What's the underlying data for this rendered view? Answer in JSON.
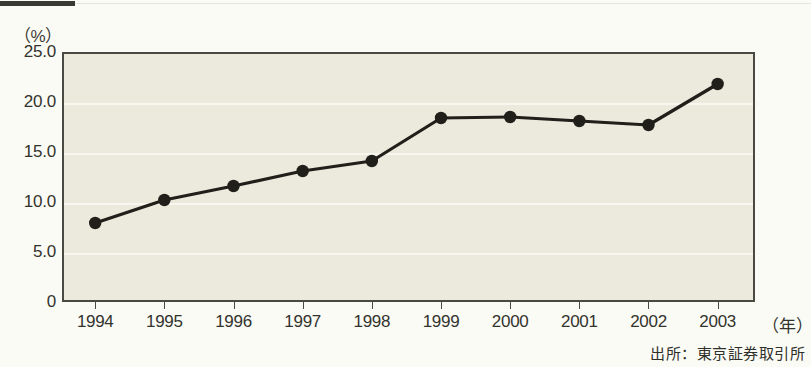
{
  "figure": {
    "unit_label": "（%）",
    "x_unit_label": "（年）",
    "source_note": "出所：東京証券取引所"
  },
  "chart_data": {
    "type": "line",
    "title": "",
    "subtitle": "",
    "xlabel": "（年）",
    "ylabel": "（%）",
    "categories": [
      "1994",
      "1995",
      "1996",
      "1997",
      "1998",
      "1999",
      "2000",
      "2001",
      "2002",
      "2003"
    ],
    "values": [
      7.9,
      10.2,
      11.6,
      13.1,
      14.1,
      18.4,
      18.5,
      18.1,
      17.7,
      21.8
    ],
    "series": [
      {
        "name": "",
        "values": [
          7.9,
          10.2,
          11.6,
          13.1,
          14.1,
          18.4,
          18.5,
          18.1,
          17.7,
          21.8
        ]
      }
    ],
    "ylim": [
      0,
      25
    ],
    "xlim": [
      "1994",
      "2003"
    ],
    "ytick_labels": [
      "25.0",
      "20.0",
      "15.0",
      "10.0",
      "5.0",
      "0"
    ],
    "ytick_values": [
      25.0,
      20.0,
      15.0,
      10.0,
      5.0,
      0
    ],
    "grid": true,
    "grid_axis": "y",
    "legend": false,
    "legend_position": "none",
    "marker": "filled-circle",
    "line_color": "#211f1a",
    "marker_color": "#211f1a",
    "plot_background": "#eceadd",
    "annotations": []
  }
}
